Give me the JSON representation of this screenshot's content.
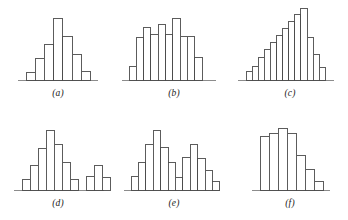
{
  "figure": {
    "name": "histogram-shapes-figure",
    "background": "#ffffff",
    "bar_stroke": "#4a4a4a",
    "bar_fill": "#ffffff",
    "axis_color": "#8c8c8c"
  },
  "panels": [
    {
      "id": "a",
      "caption": "(a)",
      "shape": "symmetric-bell",
      "baseline_y": 86,
      "bar_left": 27,
      "bar_width": 9.2,
      "max_height": 62
    },
    {
      "id": "b",
      "caption": "(b)",
      "shape": "symmetric-multimodal",
      "baseline_y": 86,
      "bar_left": 128,
      "bar_width": 7.2,
      "max_height": 62
    },
    {
      "id": "c",
      "caption": "(c)",
      "shape": "left-skewed-staircase",
      "baseline_y": 86,
      "bar_left": 242,
      "bar_width": 6.1,
      "max_height": 72
    },
    {
      "id": "d",
      "caption": "(d)",
      "shape": "bimodal-with-gap",
      "baseline_y": 196,
      "bar_left": 24,
      "bar_width": 8.0,
      "max_height": 60
    },
    {
      "id": "e",
      "caption": "(e)",
      "shape": "bimodal-adjacent",
      "baseline_y": 196,
      "bar_left": 133,
      "bar_width": 7.4,
      "max_height": 60
    },
    {
      "id": "f",
      "caption": "(f)",
      "shape": "right-skewed",
      "baseline_y": 196,
      "bar_left": 263,
      "bar_width": 9.0,
      "max_height": 62
    }
  ],
  "chart_data": [
    {
      "type": "bar",
      "id": "a",
      "title": "(a)",
      "xlabel": "",
      "ylabel": "",
      "grid": false,
      "legend": "none",
      "categories": [
        "1",
        "2",
        "3",
        "4",
        "5",
        "6",
        "7"
      ],
      "values": [
        8,
        22,
        36,
        62,
        44,
        26,
        9
      ],
      "ylim": [
        0,
        66
      ]
    },
    {
      "type": "bar",
      "id": "b",
      "title": "(b)",
      "xlabel": "",
      "ylabel": "",
      "grid": false,
      "legend": "none",
      "categories": [
        "1",
        "2",
        "3",
        "4",
        "5",
        "6",
        "7",
        "8",
        "9",
        "10"
      ],
      "values": [
        13,
        40,
        49,
        43,
        52,
        43,
        58,
        41,
        41,
        21
      ],
      "ylim": [
        0,
        66
      ]
    },
    {
      "type": "bar",
      "id": "c",
      "title": "(c)",
      "xlabel": "",
      "ylabel": "",
      "grid": false,
      "legend": "none",
      "categories": [
        "1",
        "2",
        "3",
        "4",
        "5",
        "6",
        "7",
        "8",
        "9",
        "10",
        "11",
        "12"
      ],
      "values": [
        9,
        14,
        23,
        31,
        38,
        45,
        52,
        59,
        66,
        72,
        43,
        26,
        13
      ],
      "ylim": [
        0,
        76
      ]
    },
    {
      "type": "bar",
      "id": "d",
      "title": "(d)",
      "xlabel": "",
      "ylabel": "",
      "grid": false,
      "legend": "none",
      "categories": [
        "1",
        "2",
        "3",
        "4",
        "5",
        "6",
        "7",
        "8",
        "9",
        "10",
        "11"
      ],
      "values": [
        11,
        25,
        42,
        60,
        46,
        28,
        11,
        0,
        14,
        25,
        13
      ],
      "ylim": [
        0,
        64
      ]
    },
    {
      "type": "bar",
      "id": "e",
      "title": "(e)",
      "xlabel": "",
      "ylabel": "",
      "grid": false,
      "legend": "none",
      "categories": [
        "1",
        "2",
        "3",
        "4",
        "5",
        "6",
        "7",
        "8",
        "9",
        "10",
        "11",
        "12"
      ],
      "values": [
        13,
        26,
        43,
        57,
        40,
        26,
        12,
        31,
        43,
        30,
        19,
        8
      ],
      "ylim": [
        0,
        62
      ]
    },
    {
      "type": "bar",
      "id": "f",
      "title": "(f)",
      "xlabel": "",
      "ylabel": "",
      "grid": false,
      "legend": "none",
      "categories": [
        "1",
        "2",
        "3",
        "4",
        "5",
        "6"
      ],
      "values": [
        54,
        57,
        62,
        57,
        35,
        21,
        9
      ],
      "ylim": [
        0,
        66
      ]
    }
  ]
}
